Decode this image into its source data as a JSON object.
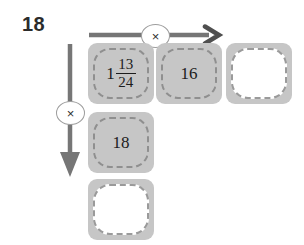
{
  "problem": {
    "number": "18"
  },
  "operators": {
    "row_operator": "×",
    "row_operator_name": "multiply",
    "column_operator": "×",
    "column_operator_name": "multiply"
  },
  "colors": {
    "cell_fill": "#c6c6c6",
    "cell_border": "#8f8f8f",
    "empty_fill": "#ffffff",
    "arrow": "#767676",
    "text": "#1c1c1c"
  },
  "grid": {
    "row": [
      {
        "id": "cell-r1c1",
        "type": "mixed-number",
        "whole": "1",
        "numerator": "13",
        "denominator": "24",
        "text": "1 13/24",
        "filled": true
      },
      {
        "id": "cell-r1c2",
        "type": "number",
        "text": "16",
        "filled": true
      },
      {
        "id": "cell-r1c3",
        "type": "blank",
        "text": "",
        "filled": false
      }
    ],
    "column": [
      {
        "id": "cell-r2c1",
        "type": "number",
        "text": "18",
        "filled": true
      },
      {
        "id": "cell-r3c1",
        "type": "blank",
        "text": "",
        "filled": false
      }
    ]
  }
}
